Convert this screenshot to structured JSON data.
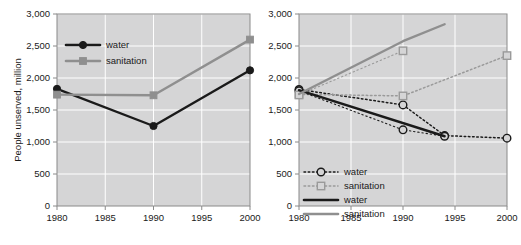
{
  "chart_data": [
    {
      "id": "left",
      "type": "line",
      "title": "",
      "xlabel": "",
      "ylabel": "People unserved, million",
      "xlim": [
        1980,
        2000
      ],
      "ylim": [
        0,
        3000
      ],
      "xticks": [
        1980,
        1985,
        1990,
        1995,
        2000
      ],
      "xticklabels": [
        "1980",
        "1985",
        "1990",
        "1995",
        "2000"
      ],
      "yticks": [
        0,
        500,
        1000,
        1500,
        2000,
        2500,
        3000
      ],
      "yticklabels": [
        "0",
        "500",
        "1,000",
        "1,500",
        "2,000",
        "2,500",
        "3,000"
      ],
      "grid": true,
      "legend_position": "upper-left-inside",
      "series": [
        {
          "name": "water",
          "color": "#1a1a1a",
          "style": "solid",
          "marker": "circle-filled",
          "x": [
            1980,
            1990,
            2000
          ],
          "values": [
            1830,
            1250,
            2120
          ]
        },
        {
          "name": "sanitation",
          "color": "#8f8f8f",
          "style": "solid",
          "marker": "square-filled",
          "x": [
            1980,
            1990,
            2000
          ],
          "values": [
            1740,
            1730,
            2600
          ]
        }
      ]
    },
    {
      "id": "right",
      "type": "line",
      "title": "",
      "xlabel": "",
      "ylabel": "",
      "xlim": [
        1980,
        2000
      ],
      "ylim": [
        0,
        3000
      ],
      "xticks": [
        1980,
        1985,
        1990,
        1995,
        2000
      ],
      "xticklabels": [
        "1980",
        "1985",
        "1990",
        "1995",
        "2000"
      ],
      "yticks": [
        0,
        500,
        1000,
        1500,
        2000,
        2500,
        3000
      ],
      "yticklabels": [
        "0",
        "500",
        "1,000",
        "1,500",
        "2,000",
        "2,500",
        "3,000"
      ],
      "grid": true,
      "legend_position": "lower-left-inside",
      "series": [
        {
          "name": "water",
          "color": "#1a1a1a",
          "style": "dashed",
          "marker": "circle-open",
          "x": [
            1980,
            1990,
            1994,
            2000
          ],
          "values": [
            1820,
            1580,
            1100,
            1060
          ]
        },
        {
          "name": "sanitation",
          "color": "#9a9a9a",
          "style": "dashed",
          "marker": "square-open",
          "x": [
            1980,
            1990,
            2000
          ],
          "values": [
            1745,
            1720,
            2350
          ]
        },
        {
          "name": "water",
          "color": "#1a1a1a",
          "style": "dashed-lower",
          "marker": "circle-open",
          "x": [
            1980,
            1990,
            1994
          ],
          "values": [
            1800,
            1190,
            1090
          ]
        },
        {
          "name": "sanitation",
          "color": "#9a9a9a",
          "style": "dashed-lower",
          "marker": "square-open",
          "x": [
            1980,
            1990
          ],
          "values": [
            1735,
            2425
          ]
        },
        {
          "name": "water",
          "color": "#1a1a1a",
          "style": "solid",
          "marker": "none",
          "x": [
            1980,
            1994
          ],
          "values": [
            1810,
            1090
          ]
        },
        {
          "name": "sanitation",
          "color": "#8f8f8f",
          "style": "solid",
          "marker": "none",
          "x": [
            1980,
            1990,
            1994
          ],
          "values": [
            1750,
            2575,
            2840
          ]
        }
      ],
      "legend_entries": [
        {
          "label": "water",
          "color": "#1a1a1a",
          "style": "dashed",
          "marker": "circle-open"
        },
        {
          "label": "sanitation",
          "color": "#9a9a9a",
          "style": "dashed",
          "marker": "square-open"
        },
        {
          "label": "water",
          "color": "#1a1a1a",
          "style": "solid",
          "marker": "none"
        },
        {
          "label": "sanitation",
          "color": "#8f8f8f",
          "style": "solid",
          "marker": "none"
        }
      ]
    }
  ]
}
